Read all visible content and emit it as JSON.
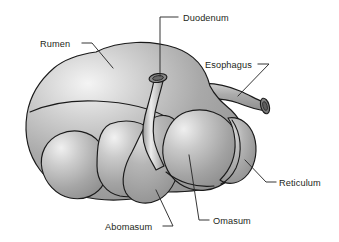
{
  "figure": {
    "name": "ruminant-stomach-anatomy",
    "background_color": "#ffffff",
    "outline_color": "#1a1a1a",
    "leader_color": "#2b2b2b",
    "text_color": "#231f20",
    "fill_light": "#f2f2f2",
    "fill_mid": "#a8a8a8",
    "fill_dark": "#8a8a8a"
  },
  "labels": [
    {
      "id": "rumen",
      "text": "Rumen",
      "x": 40,
      "y": 47,
      "anchor": "start",
      "leader": "M 82 43 L 92 43 L 113 68"
    },
    {
      "id": "duodenum",
      "text": "Duodenum",
      "x": 183,
      "y": 21,
      "anchor": "start",
      "leader": "M 178 17 L 160 17 L 160 76"
    },
    {
      "id": "esophagus",
      "text": "Esophagus",
      "x": 205,
      "y": 68,
      "anchor": "start",
      "leader": "M 258 64 L 269 64 L 238 96"
    },
    {
      "id": "reticulum",
      "text": "Reticulum",
      "x": 279,
      "y": 186,
      "anchor": "start",
      "leader": "M 276 182 L 266 182 L 245 160"
    },
    {
      "id": "omasum",
      "text": "Omasum",
      "x": 213,
      "y": 224,
      "anchor": "start",
      "leader": "M 209 220 L 199 220 L 189 155"
    },
    {
      "id": "abomasum",
      "text": "Abomasum",
      "x": 105,
      "y": 230,
      "anchor": "start",
      "leader": "M 163 226 L 173 226 L 156 190"
    }
  ],
  "parts": [
    {
      "id": "rumen",
      "label": "Rumen"
    },
    {
      "id": "reticulum",
      "label": "Reticulum"
    },
    {
      "id": "omasum",
      "label": "Omasum"
    },
    {
      "id": "abomasum",
      "label": "Abomasum"
    },
    {
      "id": "duodenum",
      "label": "Duodenum"
    },
    {
      "id": "esophagus",
      "label": "Esophagus"
    }
  ]
}
